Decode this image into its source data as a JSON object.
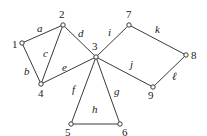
{
  "diagram": {
    "type": "graph",
    "colors": {
      "edge": "#3a3a3a",
      "node_fill": "#ffffff",
      "text": "#222222"
    },
    "nodes": [
      {
        "id": "1",
        "label": "1",
        "x": 22,
        "y": 43,
        "lx": 12,
        "ly": 48
      },
      {
        "id": "2",
        "label": "2",
        "x": 63,
        "y": 25,
        "lx": 59,
        "ly": 18
      },
      {
        "id": "3",
        "label": "3",
        "x": 96,
        "y": 57,
        "lx": 92,
        "ly": 50
      },
      {
        "id": "4",
        "label": "4",
        "x": 41,
        "y": 84,
        "lx": 38,
        "ly": 97
      },
      {
        "id": "5",
        "label": "5",
        "x": 71,
        "y": 124,
        "lx": 65,
        "ly": 136
      },
      {
        "id": "6",
        "label": "6",
        "x": 120,
        "y": 124,
        "lx": 122,
        "ly": 136
      },
      {
        "id": "7",
        "label": "7",
        "x": 129,
        "y": 25,
        "lx": 126,
        "ly": 18
      },
      {
        "id": "8",
        "label": "8",
        "x": 186,
        "y": 55,
        "lx": 191,
        "ly": 59
      },
      {
        "id": "9",
        "label": "9",
        "x": 153,
        "y": 87,
        "lx": 148,
        "ly": 99
      }
    ],
    "edges": [
      {
        "id": "a",
        "label": "a",
        "from": "1",
        "to": "2",
        "lx": 37,
        "ly": 32
      },
      {
        "id": "b",
        "label": "b",
        "from": "1",
        "to": "4",
        "lx": 24,
        "ly": 75
      },
      {
        "id": "c",
        "label": "c",
        "from": "2",
        "to": "4",
        "lx": 43,
        "ly": 57
      },
      {
        "id": "d",
        "label": "d",
        "from": "2",
        "to": "3",
        "lx": 78,
        "ly": 37
      },
      {
        "id": "e",
        "label": "e",
        "from": "4",
        "to": "3",
        "lx": 62,
        "ly": 71
      },
      {
        "id": "f",
        "label": "f",
        "from": "3",
        "to": "5",
        "lx": 72,
        "ly": 93
      },
      {
        "id": "g",
        "label": "g",
        "from": "3",
        "to": "6",
        "lx": 114,
        "ly": 95
      },
      {
        "id": "h",
        "label": "h",
        "from": "5",
        "to": "6",
        "lx": 92,
        "ly": 113
      },
      {
        "id": "i",
        "label": "i",
        "from": "3",
        "to": "7",
        "lx": 108,
        "ly": 36
      },
      {
        "id": "j",
        "label": "j",
        "from": "3",
        "to": "9",
        "lx": 130,
        "ly": 68
      },
      {
        "id": "k",
        "label": "k",
        "from": "7",
        "to": "8",
        "lx": 155,
        "ly": 33
      },
      {
        "id": "l",
        "label": "ℓ",
        "from": "8",
        "to": "9",
        "lx": 172,
        "ly": 80
      }
    ]
  }
}
